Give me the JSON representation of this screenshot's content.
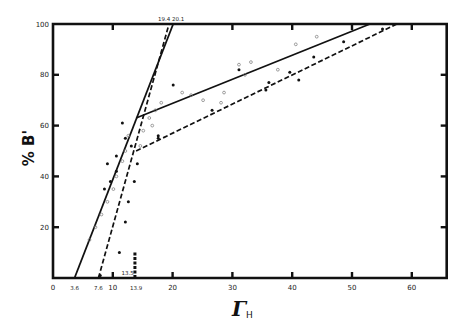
{
  "chart_data": {
    "type": "line",
    "title": "",
    "xlabel": "Γ_H",
    "xlabel_main": "Γ",
    "xlabel_sub": "H",
    "ylabel": "% B'",
    "xlim": [
      0,
      65
    ],
    "ylim": [
      0,
      100
    ],
    "grid": false,
    "x_ticks": [
      0,
      10,
      20,
      30,
      40,
      50,
      60
    ],
    "x_tick_labels": [
      "0",
      "10",
      "20",
      "30",
      "40",
      "50",
      "60"
    ],
    "y_ticks": [
      20,
      40,
      60,
      80,
      100
    ],
    "y_tick_labels": [
      "20",
      "40",
      "60",
      "80",
      "100"
    ],
    "annotations": [
      {
        "text": "3.6",
        "x": 3.6,
        "y": 0,
        "position": "below-axis"
      },
      {
        "text": "7.6",
        "x": 7.6,
        "y": 0,
        "position": "below-axis"
      },
      {
        "text": "13.9",
        "x": 13.9,
        "y": 0,
        "position": "below-axis"
      },
      {
        "text": "13.5",
        "x": 13.5,
        "y": 3,
        "position": "above-axis"
      },
      {
        "text": "19.4 20.1",
        "x": 19.75,
        "y": 100,
        "position": "above-top"
      }
    ],
    "series": [
      {
        "name": "solid steep segment",
        "style": "solid",
        "points": [
          [
            3.6,
            0
          ],
          [
            20.1,
            100
          ]
        ]
      },
      {
        "name": "solid shallow segment",
        "style": "solid",
        "points": [
          [
            13.9,
            63
          ],
          [
            53,
            100
          ]
        ]
      },
      {
        "name": "dashed steep segment",
        "style": "dashed",
        "points": [
          [
            7.6,
            0
          ],
          [
            19.4,
            100
          ]
        ]
      },
      {
        "name": "dashed shallow segment",
        "style": "dashed",
        "points": [
          [
            13.9,
            50
          ],
          [
            57.5,
            100
          ]
        ]
      },
      {
        "name": "filled points",
        "style": "marker-filled",
        "points": [
          [
            8.6,
            35
          ],
          [
            9.6,
            38
          ],
          [
            9.1,
            45
          ],
          [
            10.6,
            42
          ],
          [
            10.6,
            48
          ],
          [
            12.1,
            55
          ],
          [
            11.6,
            61
          ],
          [
            13.1,
            52
          ],
          [
            14.1,
            45
          ],
          [
            13.6,
            38
          ],
          [
            12.6,
            30
          ],
          [
            12.1,
            22
          ],
          [
            11.1,
            10
          ],
          [
            7.9,
            1
          ],
          [
            20.1,
            76
          ],
          [
            17.6,
            55
          ],
          [
            17.6,
            56
          ],
          [
            26.6,
            66
          ],
          [
            31.1,
            82
          ],
          [
            36.1,
            77
          ],
          [
            35.6,
            74
          ],
          [
            41.1,
            78
          ],
          [
            43.6,
            87
          ],
          [
            48.6,
            93
          ],
          [
            55.1,
            98
          ],
          [
            39.6,
            81
          ]
        ]
      },
      {
        "name": "open points",
        "style": "marker-open",
        "points": [
          [
            6.1,
            15
          ],
          [
            7.1,
            20
          ],
          [
            8.1,
            25
          ],
          [
            9.1,
            30
          ],
          [
            10.1,
            35
          ],
          [
            10.6,
            40
          ],
          [
            11.6,
            46
          ],
          [
            12.1,
            50
          ],
          [
            12.6,
            56
          ],
          [
            14.6,
            52
          ],
          [
            15.1,
            58
          ],
          [
            16.6,
            60
          ],
          [
            16.1,
            63
          ],
          [
            17.1,
            66
          ],
          [
            18.1,
            69
          ],
          [
            23.1,
            72
          ],
          [
            21.6,
            73
          ],
          [
            25.1,
            70
          ],
          [
            28.1,
            69
          ],
          [
            31.1,
            84
          ],
          [
            32.1,
            80
          ],
          [
            33.1,
            85
          ],
          [
            28.6,
            73
          ],
          [
            37.6,
            82
          ],
          [
            40.6,
            92
          ],
          [
            44.1,
            95
          ]
        ]
      }
    ]
  },
  "colors": {
    "axis": "#111111",
    "line": "#111111",
    "background": "#ffffff",
    "open_marker": "#777777"
  }
}
